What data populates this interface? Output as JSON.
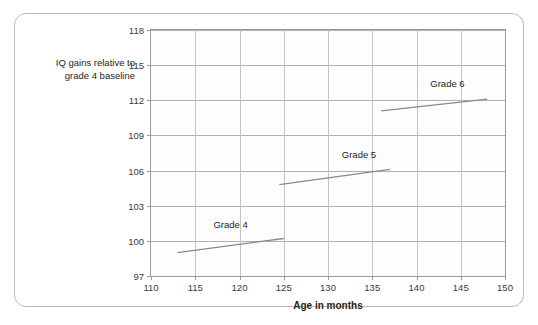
{
  "figure": {
    "y_axis_label": "IQ gains relative to grade 4 baseline",
    "y_axis_label_line1": "IQ gains relative to",
    "y_axis_label_line2": "grade 4 baseline"
  },
  "chart_data": {
    "type": "line",
    "title": "",
    "xlabel": "Age in months",
    "ylabel": "IQ gains relative to grade 4 baseline",
    "xlim": [
      110,
      150
    ],
    "ylim": [
      97,
      118
    ],
    "xticks": [
      110,
      115,
      120,
      125,
      130,
      135,
      140,
      145,
      150
    ],
    "yticks": [
      97,
      100,
      103,
      106,
      109,
      112,
      115,
      118
    ],
    "grid": true,
    "legend": "inline-annotations",
    "line_color": "#8a8a8a",
    "series": [
      {
        "name": "Grade 4",
        "label": "Grade 4",
        "label_x": 119.0,
        "label_y": 100.9,
        "x": [
          113.0,
          125.0
        ],
        "y": [
          99.0,
          100.2
        ]
      },
      {
        "name": "Grade 5",
        "label": "Grade 5",
        "label_x": 133.5,
        "label_y": 106.9,
        "x": [
          124.5,
          137.0
        ],
        "y": [
          104.8,
          106.1
        ]
      },
      {
        "name": "Grade 6",
        "label": "Grade 6",
        "label_x": 143.5,
        "label_y": 113.0,
        "x": [
          136.0,
          148.0
        ],
        "y": [
          111.1,
          112.1
        ]
      }
    ]
  }
}
